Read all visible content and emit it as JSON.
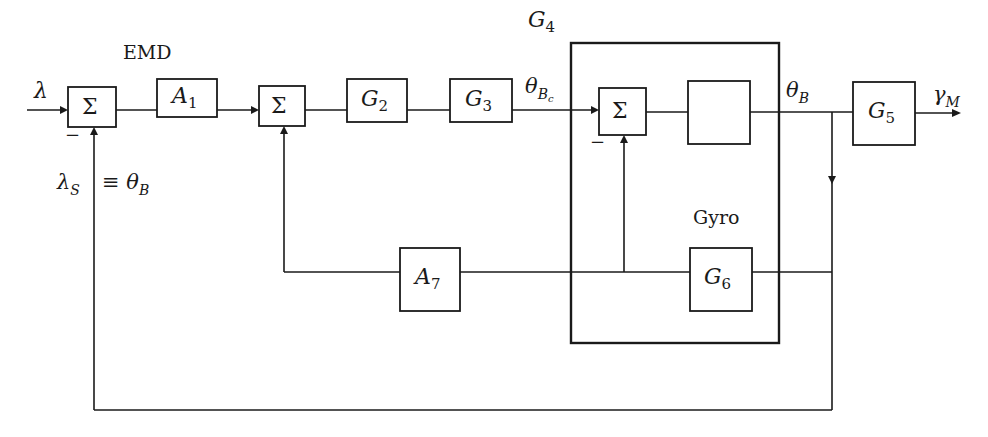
{
  "diagram": {
    "title_label": "EMD",
    "input_signal": {
      "symbol": "λ"
    },
    "output_signal": {
      "symbol": "γ",
      "subscript": "M"
    },
    "feedback_label": {
      "lhs": "λ",
      "lhs_sub": "S",
      "equiv": "≡ θ",
      "rhs_sub": "B"
    },
    "commanded_signal": {
      "symbol": "θ",
      "subscript": "B",
      "subsub": "c"
    },
    "body_signal": {
      "symbol": "θ",
      "subscript": "B"
    },
    "minus_sign": "−",
    "summers": [
      {
        "id": "sum1",
        "symbol": "Σ"
      },
      {
        "id": "sum2",
        "symbol": "Σ"
      },
      {
        "id": "sum3",
        "symbol": "Σ"
      }
    ],
    "blocks": [
      {
        "id": "A1",
        "name": "A",
        "sub": "1"
      },
      {
        "id": "G2",
        "name": "G",
        "sub": "2"
      },
      {
        "id": "G3",
        "name": "G",
        "sub": "3"
      },
      {
        "id": "G4",
        "name": "G",
        "sub": "4"
      },
      {
        "id": "G5",
        "name": "G",
        "sub": "5"
      },
      {
        "id": "G6",
        "name": "G",
        "sub": "6"
      },
      {
        "id": "A7",
        "name": "A",
        "sub": "7"
      }
    ],
    "gyro_label": "Gyro"
  }
}
